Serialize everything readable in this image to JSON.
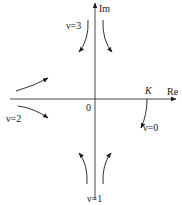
{
  "diagram": {
    "axes": {
      "real_label": "Re",
      "imag_label": "Im",
      "origin_label": "0"
    },
    "point_label": "K",
    "curves": [
      {
        "label": "ν=0",
        "position": "lower-right, starting at K"
      },
      {
        "label": "ν=1",
        "position": "bottom"
      },
      {
        "label": "ν=2",
        "position": "left"
      },
      {
        "label": "ν=3",
        "position": "top"
      }
    ],
    "colors": {
      "line": "#1a1a1a",
      "background": "#ffffff"
    }
  }
}
